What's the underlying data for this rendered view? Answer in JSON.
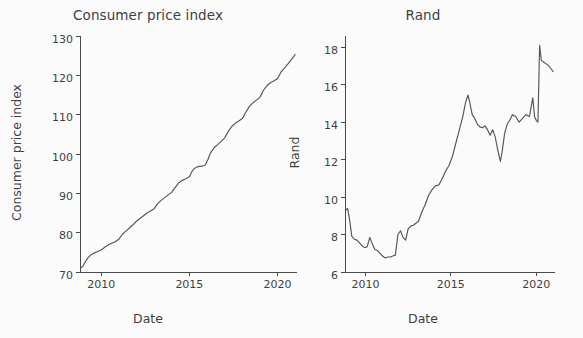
{
  "figure": {
    "background": "#fbfbfb",
    "line_color": "#555555",
    "text_color": "#3f3f3f",
    "axis_color": "#4a4a4a"
  },
  "panels": {
    "cpi": {
      "title": "Consumer price index",
      "xlabel": "Date",
      "ylabel": "Consumer price index"
    },
    "rand": {
      "title": "Rand",
      "xlabel": "Date",
      "ylabel": "Rand"
    }
  },
  "chart_data": [
    {
      "type": "line",
      "title": "Consumer price index",
      "xlabel": "Date",
      "ylabel": "Consumer price index",
      "grid": false,
      "legend": null,
      "xlim": [
        2008.8,
        2021.1
      ],
      "ylim": [
        70,
        130
      ],
      "xticks": [
        2010,
        2015,
        2020
      ],
      "xticklabels": [
        "2010",
        "2015",
        "2020"
      ],
      "yticks": [
        70,
        80,
        90,
        100,
        110,
        120,
        130
      ],
      "yticklabels": [
        "70",
        "80",
        "90",
        "100",
        "110",
        "120",
        "130"
      ],
      "series": [
        {
          "name": "Consumer price index",
          "color": "#555555",
          "x": [
            2008.85,
            2008.95,
            2009.1,
            2009.25,
            2009.4,
            2009.6,
            2009.8,
            2010.0,
            2010.2,
            2010.4,
            2010.6,
            2010.8,
            2011.0,
            2011.2,
            2011.4,
            2011.6,
            2011.8,
            2012.0,
            2012.2,
            2012.4,
            2012.6,
            2012.8,
            2013.0,
            2013.2,
            2013.4,
            2013.6,
            2013.8,
            2014.0,
            2014.2,
            2014.4,
            2014.6,
            2014.8,
            2015.0,
            2015.15,
            2015.3,
            2015.5,
            2015.7,
            2015.9,
            2016.05,
            2016.2,
            2016.4,
            2016.6,
            2016.8,
            2017.0,
            2017.2,
            2017.4,
            2017.6,
            2017.8,
            2018.0,
            2018.2,
            2018.4,
            2018.6,
            2018.8,
            2019.0,
            2019.2,
            2019.4,
            2019.6,
            2019.8,
            2020.0,
            2020.2,
            2020.4,
            2020.6,
            2020.8,
            2021.0
          ],
          "y": [
            71.1,
            71.4,
            72.6,
            73.6,
            74.3,
            74.8,
            75.2,
            75.6,
            76.3,
            76.9,
            77.3,
            77.7,
            78.3,
            79.6,
            80.4,
            81.2,
            82.0,
            82.9,
            83.6,
            84.3,
            85.0,
            85.5,
            86.1,
            87.4,
            88.2,
            88.9,
            89.6,
            90.3,
            91.5,
            92.7,
            93.3,
            93.7,
            94.2,
            95.6,
            96.4,
            96.8,
            96.9,
            97.2,
            98.6,
            100.3,
            101.6,
            102.4,
            103.2,
            104.1,
            105.7,
            107.0,
            107.8,
            108.4,
            109.0,
            110.6,
            112.1,
            113.0,
            113.7,
            114.4,
            116.2,
            117.4,
            118.1,
            118.6,
            119.2,
            120.9,
            121.9,
            123.0,
            124.1,
            125.3
          ]
        }
      ]
    },
    {
      "type": "line",
      "title": "Rand",
      "xlabel": "Date",
      "ylabel": "Rand",
      "grid": false,
      "legend": null,
      "xlim": [
        2008.8,
        2021.1
      ],
      "ylim": [
        6,
        18.6
      ],
      "xticks": [
        2010,
        2015,
        2020
      ],
      "xticklabels": [
        "2010",
        "2015",
        "2020"
      ],
      "yticks": [
        6,
        8,
        10,
        12,
        14,
        16,
        18
      ],
      "yticklabels": [
        "6",
        "8",
        "10",
        "12",
        "14",
        "16",
        "18"
      ],
      "series": [
        {
          "name": "Rand",
          "color": "#555555",
          "x": [
            2008.85,
            2008.95,
            2009.05,
            2009.2,
            2009.35,
            2009.5,
            2009.65,
            2009.8,
            2009.95,
            2010.1,
            2010.25,
            2010.4,
            2010.55,
            2010.7,
            2010.85,
            2011.0,
            2011.15,
            2011.3,
            2011.45,
            2011.6,
            2011.75,
            2011.9,
            2012.05,
            2012.2,
            2012.35,
            2012.5,
            2012.65,
            2012.8,
            2012.95,
            2013.1,
            2013.3,
            2013.5,
            2013.7,
            2013.9,
            2014.1,
            2014.3,
            2014.5,
            2014.7,
            2014.9,
            2015.1,
            2015.3,
            2015.5,
            2015.7,
            2015.85,
            2016.0,
            2016.1,
            2016.25,
            2016.4,
            2016.55,
            2016.7,
            2016.85,
            2017.0,
            2017.15,
            2017.3,
            2017.45,
            2017.6,
            2017.75,
            2017.9,
            2018.0,
            2018.15,
            2018.3,
            2018.45,
            2018.6,
            2018.8,
            2019.0,
            2019.2,
            2019.4,
            2019.6,
            2019.8,
            2019.9,
            2020.0,
            2020.1,
            2020.2,
            2020.3,
            2020.45,
            2020.6,
            2020.75,
            2020.9,
            2021.0
          ],
          "y": [
            9.3,
            9.4,
            8.9,
            7.9,
            7.75,
            7.7,
            7.55,
            7.4,
            7.3,
            7.35,
            7.85,
            7.5,
            7.2,
            7.15,
            7.0,
            6.85,
            6.75,
            6.8,
            6.8,
            6.85,
            6.9,
            8.0,
            8.2,
            7.85,
            7.7,
            8.3,
            8.45,
            8.5,
            8.6,
            8.7,
            9.2,
            9.6,
            10.1,
            10.4,
            10.6,
            10.65,
            11.0,
            11.4,
            11.7,
            12.2,
            12.9,
            13.6,
            14.3,
            15.0,
            15.45,
            15.1,
            14.4,
            14.2,
            13.9,
            13.75,
            13.7,
            13.8,
            13.6,
            13.3,
            13.6,
            13.2,
            12.5,
            11.9,
            12.4,
            13.4,
            13.9,
            14.1,
            14.4,
            14.3,
            14.0,
            14.2,
            14.4,
            14.3,
            15.3,
            14.3,
            14.1,
            14.0,
            18.1,
            17.3,
            17.2,
            17.1,
            17.0,
            16.8,
            16.7
          ]
        }
      ]
    }
  ]
}
